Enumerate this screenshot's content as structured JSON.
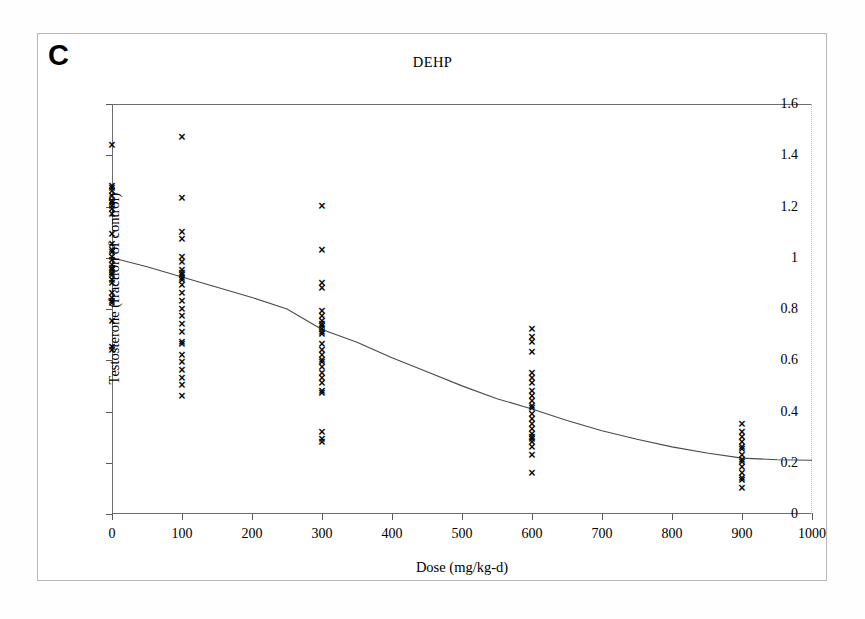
{
  "figure": {
    "panel_label": "C",
    "title": "DEHP"
  },
  "axes": {
    "x_title": "Dose (mg/kg-d)",
    "y_title": "Testosterone (fraction of control)",
    "x_ticks": [
      "0",
      "100",
      "200",
      "300",
      "400",
      "500",
      "600",
      "700",
      "800",
      "900",
      "1000"
    ],
    "y_ticks": [
      "0",
      "0.2",
      "0.4",
      "0.6",
      "0.8",
      "1",
      "1.2",
      "1.4",
      "1.6"
    ]
  },
  "chart_data": {
    "type": "scatter",
    "title": "DEHP",
    "xlabel": "Dose (mg/kg-d)",
    "ylabel": "Testosterone (fraction of control)",
    "xlim": [
      0,
      1000
    ],
    "ylim": [
      0,
      1.6
    ],
    "x_tick_values": [
      0,
      100,
      200,
      300,
      400,
      500,
      600,
      700,
      800,
      900,
      1000
    ],
    "y_tick_values": [
      0,
      0.2,
      0.4,
      0.6,
      0.8,
      1,
      1.2,
      1.4,
      1.6
    ],
    "grid": false,
    "legend": null,
    "marker": "x",
    "marker_color": "#0b0b0b",
    "series": [
      {
        "name": "Observed testosterone (individual animals)",
        "points": [
          {
            "x": 0,
            "y": 1.44
          },
          {
            "x": 0,
            "y": 1.28
          },
          {
            "x": 0,
            "y": 1.27
          },
          {
            "x": 0,
            "y": 1.26
          },
          {
            "x": 0,
            "y": 1.24
          },
          {
            "x": 0,
            "y": 1.22
          },
          {
            "x": 0,
            "y": 1.21
          },
          {
            "x": 0,
            "y": 1.2
          },
          {
            "x": 0,
            "y": 1.19
          },
          {
            "x": 0,
            "y": 1.17
          },
          {
            "x": 0,
            "y": 1.09
          },
          {
            "x": 0,
            "y": 1.05
          },
          {
            "x": 0,
            "y": 1.03
          },
          {
            "x": 0,
            "y": 1.02
          },
          {
            "x": 0,
            "y": 1.0
          },
          {
            "x": 0,
            "y": 0.99
          },
          {
            "x": 0,
            "y": 0.97
          },
          {
            "x": 0,
            "y": 0.96
          },
          {
            "x": 0,
            "y": 0.95
          },
          {
            "x": 0,
            "y": 0.94
          },
          {
            "x": 0,
            "y": 0.93
          },
          {
            "x": 0,
            "y": 0.91
          },
          {
            "x": 0,
            "y": 0.9
          },
          {
            "x": 0,
            "y": 0.86
          },
          {
            "x": 0,
            "y": 0.84
          },
          {
            "x": 0,
            "y": 0.83
          },
          {
            "x": 0,
            "y": 0.82
          },
          {
            "x": 0,
            "y": 0.75
          },
          {
            "x": 0,
            "y": 0.65
          },
          {
            "x": 0,
            "y": 0.64
          },
          {
            "x": 100,
            "y": 1.47
          },
          {
            "x": 100,
            "y": 1.23
          },
          {
            "x": 100,
            "y": 1.1
          },
          {
            "x": 100,
            "y": 1.07
          },
          {
            "x": 100,
            "y": 1.0
          },
          {
            "x": 100,
            "y": 0.98
          },
          {
            "x": 100,
            "y": 0.95
          },
          {
            "x": 100,
            "y": 0.94
          },
          {
            "x": 100,
            "y": 0.93
          },
          {
            "x": 100,
            "y": 0.92
          },
          {
            "x": 100,
            "y": 0.91
          },
          {
            "x": 100,
            "y": 0.89
          },
          {
            "x": 100,
            "y": 0.86
          },
          {
            "x": 100,
            "y": 0.83
          },
          {
            "x": 100,
            "y": 0.8
          },
          {
            "x": 100,
            "y": 0.77
          },
          {
            "x": 100,
            "y": 0.74
          },
          {
            "x": 100,
            "y": 0.71
          },
          {
            "x": 100,
            "y": 0.67
          },
          {
            "x": 100,
            "y": 0.66
          },
          {
            "x": 100,
            "y": 0.62
          },
          {
            "x": 100,
            "y": 0.59
          },
          {
            "x": 100,
            "y": 0.56
          },
          {
            "x": 100,
            "y": 0.53
          },
          {
            "x": 100,
            "y": 0.5
          },
          {
            "x": 100,
            "y": 0.46
          },
          {
            "x": 300,
            "y": 1.2
          },
          {
            "x": 300,
            "y": 1.03
          },
          {
            "x": 300,
            "y": 0.9
          },
          {
            "x": 300,
            "y": 0.88
          },
          {
            "x": 300,
            "y": 0.79
          },
          {
            "x": 300,
            "y": 0.77
          },
          {
            "x": 300,
            "y": 0.75
          },
          {
            "x": 300,
            "y": 0.74
          },
          {
            "x": 300,
            "y": 0.73
          },
          {
            "x": 300,
            "y": 0.72
          },
          {
            "x": 300,
            "y": 0.71
          },
          {
            "x": 300,
            "y": 0.7
          },
          {
            "x": 300,
            "y": 0.66
          },
          {
            "x": 300,
            "y": 0.64
          },
          {
            "x": 300,
            "y": 0.62
          },
          {
            "x": 300,
            "y": 0.6
          },
          {
            "x": 300,
            "y": 0.59
          },
          {
            "x": 300,
            "y": 0.57
          },
          {
            "x": 300,
            "y": 0.55
          },
          {
            "x": 300,
            "y": 0.53
          },
          {
            "x": 300,
            "y": 0.51
          },
          {
            "x": 300,
            "y": 0.48
          },
          {
            "x": 300,
            "y": 0.47
          },
          {
            "x": 300,
            "y": 0.32
          },
          {
            "x": 300,
            "y": 0.29
          },
          {
            "x": 300,
            "y": 0.28
          },
          {
            "x": 600,
            "y": 0.72
          },
          {
            "x": 600,
            "y": 0.69
          },
          {
            "x": 600,
            "y": 0.67
          },
          {
            "x": 600,
            "y": 0.63
          },
          {
            "x": 600,
            "y": 0.55
          },
          {
            "x": 600,
            "y": 0.53
          },
          {
            "x": 600,
            "y": 0.51
          },
          {
            "x": 600,
            "y": 0.48
          },
          {
            "x": 600,
            "y": 0.46
          },
          {
            "x": 600,
            "y": 0.44
          },
          {
            "x": 600,
            "y": 0.42
          },
          {
            "x": 600,
            "y": 0.41
          },
          {
            "x": 600,
            "y": 0.39
          },
          {
            "x": 600,
            "y": 0.37
          },
          {
            "x": 600,
            "y": 0.35
          },
          {
            "x": 600,
            "y": 0.33
          },
          {
            "x": 600,
            "y": 0.31
          },
          {
            "x": 600,
            "y": 0.3
          },
          {
            "x": 600,
            "y": 0.29
          },
          {
            "x": 600,
            "y": 0.28
          },
          {
            "x": 600,
            "y": 0.26
          },
          {
            "x": 600,
            "y": 0.23
          },
          {
            "x": 600,
            "y": 0.16
          },
          {
            "x": 900,
            "y": 0.35
          },
          {
            "x": 900,
            "y": 0.32
          },
          {
            "x": 900,
            "y": 0.3
          },
          {
            "x": 900,
            "y": 0.28
          },
          {
            "x": 900,
            "y": 0.26
          },
          {
            "x": 900,
            "y": 0.25
          },
          {
            "x": 900,
            "y": 0.23
          },
          {
            "x": 900,
            "y": 0.21
          },
          {
            "x": 900,
            "y": 0.2
          },
          {
            "x": 900,
            "y": 0.18
          },
          {
            "x": 900,
            "y": 0.16
          },
          {
            "x": 900,
            "y": 0.14
          },
          {
            "x": 900,
            "y": 0.13
          },
          {
            "x": 900,
            "y": 0.1
          }
        ]
      }
    ],
    "fit_curve": {
      "name": "Fitted dose-response model",
      "color": "#4a4a4a",
      "points": [
        {
          "x": 0,
          "y": 1.0
        },
        {
          "x": 50,
          "y": 0.965
        },
        {
          "x": 100,
          "y": 0.925
        },
        {
          "x": 150,
          "y": 0.885
        },
        {
          "x": 200,
          "y": 0.845
        },
        {
          "x": 250,
          "y": 0.8
        },
        {
          "x": 300,
          "y": 0.72
        },
        {
          "x": 350,
          "y": 0.67
        },
        {
          "x": 400,
          "y": 0.61
        },
        {
          "x": 450,
          "y": 0.555
        },
        {
          "x": 500,
          "y": 0.5
        },
        {
          "x": 550,
          "y": 0.45
        },
        {
          "x": 600,
          "y": 0.41
        },
        {
          "x": 650,
          "y": 0.365
        },
        {
          "x": 700,
          "y": 0.325
        },
        {
          "x": 750,
          "y": 0.292
        },
        {
          "x": 800,
          "y": 0.262
        },
        {
          "x": 850,
          "y": 0.238
        },
        {
          "x": 900,
          "y": 0.218
        },
        {
          "x": 950,
          "y": 0.212
        },
        {
          "x": 1000,
          "y": 0.21
        }
      ]
    }
  }
}
